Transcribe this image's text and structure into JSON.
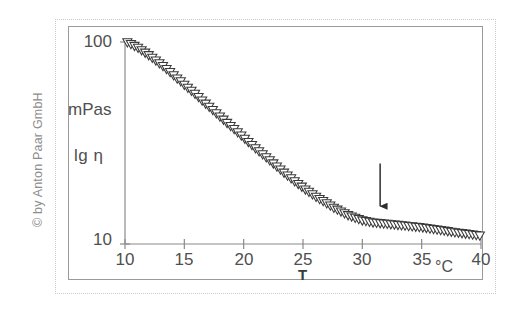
{
  "figure": {
    "copyright": "© by Anton Paar GmbH"
  },
  "chart_data": {
    "type": "scatter",
    "title": "",
    "subtitle": "",
    "xlabel": "T",
    "xunit": "°C",
    "ylabel": "lg η",
    "yunit": "mPas",
    "xlim": [
      10,
      40
    ],
    "ylim": [
      10,
      100
    ],
    "yscale": "log",
    "xscale": "linear",
    "grid": false,
    "legend": null,
    "xticks": [
      10,
      15,
      20,
      25,
      30,
      35,
      40
    ],
    "xticklabels": [
      "10",
      "15",
      "20",
      "25",
      "30",
      "35",
      "40"
    ],
    "yticks": [
      10,
      100
    ],
    "yticklabels": [
      "10",
      "100"
    ],
    "marker": "triangle-down-open",
    "marker_color": "#ffffff",
    "marker_edge_color": "#3a3a3a",
    "series": [
      {
        "name": "viscosity",
        "x": [
          10.2,
          10.5,
          10.8,
          11.1,
          11.4,
          11.7,
          12.0,
          12.3,
          12.6,
          12.9,
          13.2,
          13.5,
          13.8,
          14.1,
          14.4,
          14.7,
          15.0,
          15.3,
          15.6,
          15.9,
          16.2,
          16.5,
          16.8,
          17.1,
          17.4,
          17.7,
          18.0,
          18.3,
          18.6,
          18.9,
          19.2,
          19.5,
          19.8,
          20.1,
          20.4,
          20.7,
          21.0,
          21.3,
          21.6,
          21.9,
          22.2,
          22.5,
          22.8,
          23.1,
          23.4,
          23.7,
          24.0,
          24.3,
          24.6,
          24.9,
          25.2,
          25.5,
          25.8,
          26.1,
          26.4,
          26.7,
          27.0,
          27.3,
          27.6,
          27.9,
          28.2,
          28.5,
          28.8,
          29.1,
          29.4,
          29.7,
          30.0,
          30.3,
          30.6,
          30.9,
          31.2,
          31.5,
          31.8,
          32.1,
          32.4,
          32.7,
          33.0,
          33.3,
          33.6,
          33.9,
          34.2,
          34.5,
          34.8,
          35.1,
          35.4,
          35.7,
          36.0,
          36.3,
          36.6,
          36.9,
          37.2,
          37.5,
          37.8,
          38.1,
          38.4,
          38.7,
          39.0,
          39.3,
          39.6,
          39.9
        ],
        "y": [
          99.0,
          97.0,
          95.0,
          93.0,
          90.5,
          88.0,
          85.5,
          83.0,
          80.5,
          78.0,
          75.5,
          73.0,
          70.5,
          68.0,
          65.5,
          63.5,
          61.0,
          59.0,
          57.0,
          55.0,
          53.0,
          51.0,
          49.2,
          47.5,
          45.8,
          44.1,
          42.5,
          41.0,
          39.5,
          38.1,
          36.8,
          35.5,
          34.2,
          33.0,
          31.8,
          30.7,
          29.6,
          28.6,
          27.6,
          26.7,
          25.8,
          24.9,
          24.0,
          23.2,
          22.4,
          21.7,
          21.0,
          20.3,
          19.7,
          19.1,
          18.5,
          18.0,
          17.5,
          17.0,
          16.6,
          16.2,
          15.8,
          15.4,
          15.0,
          14.7,
          14.4,
          14.1,
          13.8,
          13.6,
          13.4,
          13.2,
          13.0,
          12.9,
          12.8,
          12.7,
          12.65,
          12.6,
          12.55,
          12.5,
          12.45,
          12.4,
          12.35,
          12.3,
          12.25,
          12.2,
          12.15,
          12.1,
          12.05,
          12.0,
          11.93,
          11.86,
          11.79,
          11.72,
          11.65,
          11.58,
          11.5,
          11.43,
          11.36,
          11.3,
          11.24,
          11.18,
          11.12,
          11.06,
          11.0,
          10.95
        ]
      }
    ],
    "annotations": [
      {
        "type": "arrow-down",
        "x": 31.5,
        "y_top": 25.0,
        "y_tip": 14.2,
        "label": ""
      }
    ]
  }
}
